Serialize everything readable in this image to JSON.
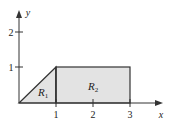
{
  "diagram": {
    "axes": {
      "x_label": "x",
      "y_label": "y"
    },
    "x_ticks": [
      "1",
      "2",
      "3"
    ],
    "y_ticks": [
      "1",
      "2"
    ],
    "regions": [
      {
        "name": "R",
        "sub": "1",
        "shape": "triangle",
        "vertices": [
          [
            0,
            0
          ],
          [
            1,
            1
          ],
          [
            1,
            0
          ]
        ]
      },
      {
        "name": "R",
        "sub": "2",
        "shape": "rectangle",
        "vertices": [
          [
            1,
            0
          ],
          [
            3,
            0
          ],
          [
            3,
            1
          ],
          [
            1,
            1
          ]
        ]
      }
    ],
    "colors": {
      "fill": "#e3e3e3",
      "stroke": "#333333"
    }
  }
}
